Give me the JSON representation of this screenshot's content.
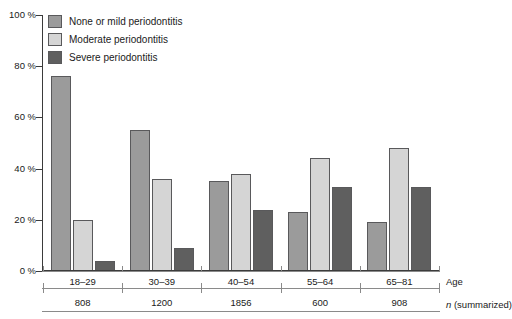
{
  "chart_data": {
    "type": "bar",
    "title": "",
    "xlabel": "Age",
    "ylabel": "",
    "ylim": [
      0,
      100
    ],
    "grid": false,
    "legend_position": "top-left",
    "categories": [
      "18–29",
      "30–39",
      "40–54",
      "55–64",
      "65–81"
    ],
    "series": [
      {
        "name": "None or mild periodontitis",
        "color": "#9b9b9b",
        "values": [
          76,
          55,
          35,
          23,
          19
        ]
      },
      {
        "name": "Moderate periodontitis",
        "color": "#d5d5d5",
        "values": [
          20,
          36,
          38,
          44,
          48
        ]
      },
      {
        "name": "Severe periodontitis",
        "color": "#5f5f5f",
        "values": [
          4,
          9,
          24,
          33,
          33
        ]
      }
    ],
    "ytick_labels": [
      "100 %",
      "80 %",
      "60 %",
      "40 %",
      "20 %",
      "0 %"
    ],
    "ytick_values": [
      100,
      80,
      60,
      40,
      20,
      0
    ],
    "annotations": {
      "n_row_label_prefix": "n",
      "n_row_label_suffix": " (summarized)",
      "n_values": [
        "808",
        "1200",
        "1856",
        "600",
        "908"
      ]
    }
  },
  "axis": {
    "age_row_label": "Age"
  }
}
